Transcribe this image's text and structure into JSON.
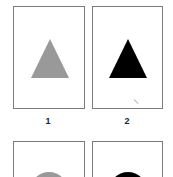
{
  "cards": [
    {
      "label": "1",
      "shape": "triangle",
      "color": "#999999"
    },
    {
      "label": "2",
      "shape": "triangle",
      "color": "#000000"
    },
    {
      "label": "",
      "shape": "circle",
      "color": "#999999"
    },
    {
      "label": "",
      "shape": "circle",
      "color": "#000000"
    }
  ]
}
